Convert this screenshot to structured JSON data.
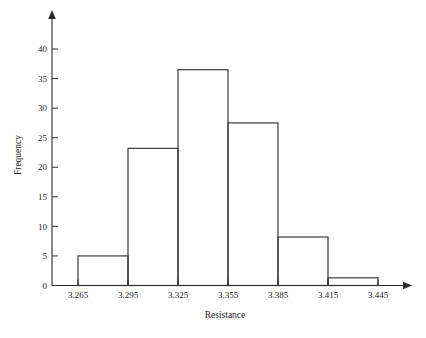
{
  "chart_data": {
    "type": "bar",
    "title": "",
    "xlabel": "Resistance",
    "ylabel": "Frequency",
    "categories": [
      "3.265-3.295",
      "3.295-3.325",
      "3.325-3.355",
      "3.355-3.385",
      "3.385-3.415",
      "3.415-3.445"
    ],
    "bin_edges": [
      3.265,
      3.295,
      3.325,
      3.355,
      3.385,
      3.415,
      3.445
    ],
    "values": [
      5,
      23.2,
      36.5,
      27.5,
      8.2,
      1.3
    ],
    "xtick_labels": [
      "3.265",
      "3.295",
      "3.325",
      "3.355",
      "3.385",
      "3.415",
      "3.445"
    ],
    "ytick_labels": [
      "0",
      "5",
      "10",
      "15",
      "20",
      "25",
      "30",
      "35",
      "40"
    ],
    "ytick_values": [
      0,
      5,
      10,
      15,
      20,
      25,
      30,
      35,
      40
    ],
    "ylim": [
      0,
      43
    ],
    "xlim": [
      3.25,
      3.46
    ],
    "grid": false,
    "legend": null,
    "bar_fill": "#ffffff",
    "bar_stroke": "#3a3a3a",
    "axis_color": "#2b2b2b",
    "background": "#ffffff"
  }
}
